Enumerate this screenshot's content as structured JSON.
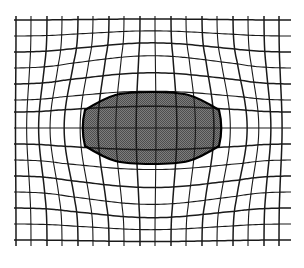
{
  "figure": {
    "kind": "deformed-grid-diagram",
    "background_color": "#ffffff",
    "canvas": {
      "width": 304,
      "height": 268
    }
  },
  "chart_data": {
    "type": "diagram-mesh",
    "xlabel": "",
    "ylabel": "",
    "grid": true,
    "legend": "none",
    "plot_area": {
      "x": 14,
      "y": 16,
      "width": 277,
      "height": 230
    },
    "xlim": [
      14,
      291
    ],
    "ylim": [
      16,
      246
    ],
    "n_vertical_lines": 18,
    "n_horizontal_lines": 15,
    "vertical_line_x": [
      16,
      31,
      47,
      62,
      78,
      93,
      109,
      124,
      140,
      155,
      171,
      186,
      202,
      217,
      233,
      248,
      264,
      279
    ],
    "horizontal_line_y": [
      20,
      36,
      52,
      68,
      84,
      100,
      112,
      128,
      144,
      160,
      176,
      192,
      208,
      224,
      240
    ],
    "line_color": "#1a1a1a",
    "line_width_major": 1.5,
    "line_width_minor": 1.1,
    "inclusion": {
      "label": "shaded inclusion",
      "fill_color": "#6e6e6e",
      "pattern": "halftone-checker",
      "pattern_light": "#8a8a8a",
      "pattern_dark": "#4a4a4a",
      "outline_color": "#000000",
      "outline_width": 2.2,
      "center_x": 152,
      "center_y": 128,
      "left_x": 85,
      "right_x": 219,
      "top_y_center": 96,
      "bottom_y_center": 160,
      "top_y_edge": 110,
      "bottom_y_edge": 146,
      "spans_columns": 10,
      "spans_rows": 2
    },
    "deformation": {
      "type": "radial-expansion",
      "amplitude_x": 15,
      "amplitude_y": 13,
      "falloff_sigma_x": 78,
      "falloff_sigma_y": 56,
      "center_x": 152,
      "center_y": 128
    }
  }
}
